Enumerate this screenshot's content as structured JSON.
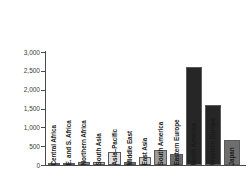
{
  "chart_data": {
    "type": "bar",
    "title": "",
    "subtitle": "",
    "xlabel": "",
    "ylabel": "",
    "ylim": [
      0,
      3000
    ],
    "grid": false,
    "legend": "none",
    "yticks": [
      "0",
      "500",
      "1,000",
      "1,500",
      "2,000",
      "2,500",
      "3,000"
    ],
    "ytick_values": [
      0,
      500,
      1000,
      1500,
      2000,
      2500,
      3000
    ],
    "categories": [
      "Central Africa",
      "E. and S. Africa",
      "Northern Africa",
      "South Asia",
      "Asia–Pacific",
      "Middle East",
      "East Asia",
      "South America",
      "Eastern Europe",
      "North America",
      "Western Europe",
      "Japan"
    ],
    "values": [
      10,
      30,
      70,
      70,
      350,
      80,
      220,
      400,
      300,
      2600,
      1600,
      670
    ],
    "bar_colors": [
      "#d9d9d9",
      "#8c8c8c",
      "#8c8c8c",
      "#bdbdbd",
      "#e0e0e0",
      "#6e6e6e",
      "#d0d0d0",
      "#9a9a9a",
      "#6b6b6b",
      "#262626",
      "#262626",
      "#6e6e6e"
    ]
  },
  "colors": {
    "axis": "#4a4a4a",
    "text": "#3b3b3b",
    "label": "#1a1a1a",
    "background": "#ffffff"
  }
}
